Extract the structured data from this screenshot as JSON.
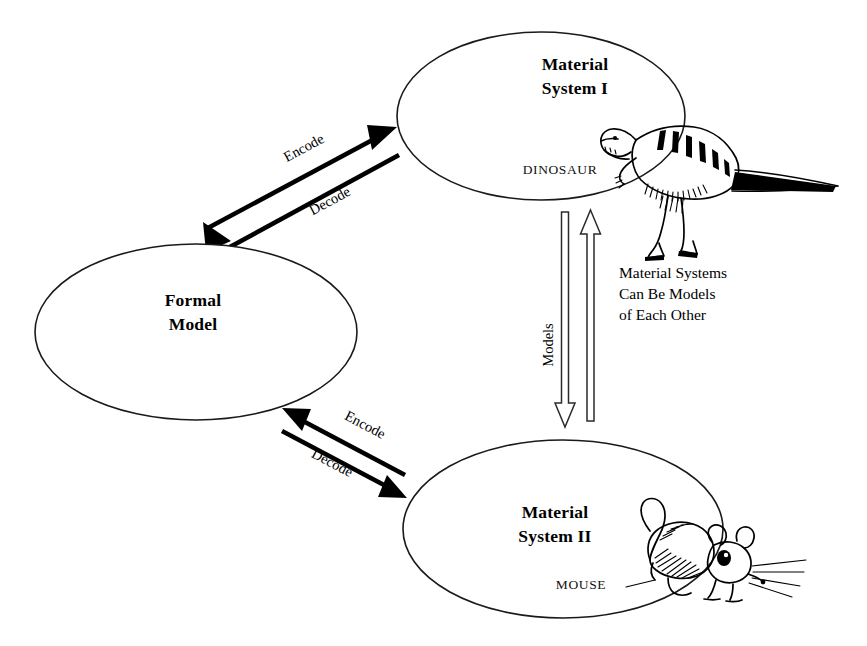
{
  "diagram": {
    "background_color": "#ffffff",
    "ink_color": "#000000",
    "nodes": [
      {
        "id": "material-system-1",
        "label_line1": "Material",
        "label_line2": "System I",
        "species_label": "DINOSAUR",
        "illustration": "dinosaur-illustration",
        "cx": 541,
        "cy": 116,
        "rx": 144,
        "ry": 84
      },
      {
        "id": "formal-model",
        "label_line1": "Formal",
        "label_line2": "Model",
        "species_label": "",
        "illustration": "",
        "cx": 196,
        "cy": 332,
        "rx": 161,
        "ry": 88
      },
      {
        "id": "material-system-2",
        "label_line1": "Material",
        "label_line2": "System II",
        "species_label": "MOUSE",
        "illustration": "mouse-illustration",
        "cx": 563,
        "cy": 529,
        "rx": 160,
        "ry": 89
      }
    ],
    "edges": [
      {
        "id": "encode-upper",
        "label": "Encode",
        "from": "formal-model",
        "to": "material-system-1",
        "style": "solid-filled-arrow"
      },
      {
        "id": "decode-upper",
        "label": "Decode",
        "from": "material-system-1",
        "to": "formal-model",
        "style": "solid-filled-arrow"
      },
      {
        "id": "encode-lower",
        "label": "Encode",
        "from": "material-system-2",
        "to": "formal-model",
        "style": "solid-filled-arrow"
      },
      {
        "id": "decode-lower",
        "label": "Decode",
        "from": "formal-model",
        "to": "material-system-2",
        "style": "solid-filled-arrow"
      },
      {
        "id": "models-down",
        "label": "Models",
        "from": "material-system-1",
        "to": "material-system-2",
        "style": "hollow-outline-arrow"
      },
      {
        "id": "models-up",
        "label": "",
        "from": "material-system-2",
        "to": "material-system-1",
        "style": "hollow-outline-arrow"
      }
    ],
    "annotation": {
      "id": "material-systems-note",
      "line1": "Material Systems",
      "line2": "Can Be Models",
      "line3": "of Each Other"
    }
  }
}
